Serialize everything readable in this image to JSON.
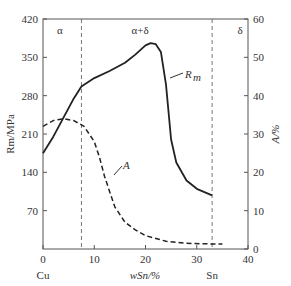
{
  "chart_data": {
    "type": "line",
    "title": "",
    "xlabel": "w_Sn/%",
    "ylabel_left": "R_m/MPa",
    "ylabel_right": "A/%",
    "xlim": [
      0,
      40
    ],
    "ylim_left": [
      0,
      420
    ],
    "ylim_right": [
      0,
      60
    ],
    "xticks": [
      "0",
      "10",
      "20",
      "30",
      "40"
    ],
    "yticks_left": [
      "70",
      "140",
      "210",
      "280",
      "350",
      "420"
    ],
    "yticks_right": [
      "0",
      "10",
      "20",
      "30",
      "40",
      "50",
      "60"
    ],
    "x_end_labels": {
      "left": "Cu",
      "right": "Sn"
    },
    "regions": [
      "α",
      "α+δ",
      "δ"
    ],
    "boundaries": [
      7.5,
      33
    ],
    "series": [
      {
        "name": "R_m",
        "axis": "left",
        "style": "solid",
        "x": [
          0,
          2,
          4,
          6,
          7.5,
          10,
          13,
          16,
          18,
          20,
          21,
          22,
          23,
          24,
          25,
          26,
          28,
          30,
          33
        ],
        "values": [
          175,
          205,
          240,
          275,
          297,
          312,
          325,
          340,
          355,
          372,
          376,
          374,
          360,
          300,
          200,
          158,
          125,
          110,
          98
        ]
      },
      {
        "name": "A",
        "axis": "right",
        "style": "dashed",
        "x": [
          0,
          2,
          4,
          6,
          8,
          10,
          11,
          12,
          13,
          14,
          16,
          18,
          20,
          24,
          28,
          33,
          35
        ],
        "values": [
          32,
          33.5,
          34,
          33.5,
          32,
          28,
          24,
          19,
          15,
          11,
          7,
          5,
          3.5,
          2,
          1.5,
          1.3,
          1.3
        ]
      }
    ]
  }
}
